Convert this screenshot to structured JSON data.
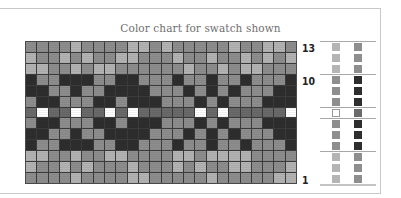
{
  "title": "Color chart for swatch shown",
  "colors": {
    "D": "#2e2e2e",
    "G": "#6a6a6a",
    "M": "#8e8e8e",
    "L": "#b4b4b4",
    "W": "#ffffff"
  },
  "row_labels": [
    {
      "text": "13",
      "row": 13
    },
    {
      "text": "10",
      "row": 10
    },
    {
      "text": "1",
      "row": 1
    }
  ],
  "chart_data": {
    "type": "heatmap",
    "title": "Color chart for swatch shown",
    "columns": 24,
    "rows": 13,
    "legend_key": {
      "D": "dark",
      "G": "dark gray",
      "M": "medium gray",
      "L": "light gray",
      "W": "white"
    },
    "grid_top_to_bottom": [
      [
        "M",
        "M",
        "M",
        "M",
        "L",
        "M",
        "M",
        "M",
        "M",
        "L",
        "L",
        "M",
        "L",
        "M",
        "M",
        "M",
        "M",
        "M",
        "L",
        "M",
        "M",
        "L",
        "L",
        "M"
      ],
      [
        "L",
        "M",
        "M",
        "L",
        "M",
        "L",
        "M",
        "M",
        "L",
        "L",
        "M",
        "M",
        "M",
        "L",
        "M",
        "M",
        "L",
        "M",
        "M",
        "L",
        "M",
        "L",
        "M",
        "L"
      ],
      [
        "L",
        "L",
        "M",
        "M",
        "L",
        "M",
        "L",
        "L",
        "M",
        "M",
        "M",
        "M",
        "M",
        "M",
        "L",
        "M",
        "M",
        "L",
        "M",
        "L",
        "L",
        "M",
        "M",
        "M"
      ],
      [
        "D",
        "M",
        "M",
        "D",
        "D",
        "D",
        "M",
        "M",
        "D",
        "D",
        "M",
        "M",
        "M",
        "D",
        "M",
        "M",
        "D",
        "M",
        "M",
        "D",
        "M",
        "M",
        "M",
        "D"
      ],
      [
        "D",
        "D",
        "M",
        "M",
        "D",
        "M",
        "M",
        "D",
        "D",
        "D",
        "D",
        "M",
        "M",
        "M",
        "D",
        "M",
        "D",
        "M",
        "D",
        "M",
        "M",
        "M",
        "D",
        "D"
      ],
      [
        "M",
        "D",
        "D",
        "M",
        "M",
        "M",
        "D",
        "D",
        "M",
        "D",
        "D",
        "D",
        "M",
        "M",
        "M",
        "D",
        "M",
        "D",
        "M",
        "M",
        "M",
        "D",
        "D",
        "D"
      ],
      [
        "G",
        "W",
        "G",
        "G",
        "W",
        "G",
        "G",
        "W",
        "G",
        "W",
        "G",
        "G",
        "G",
        "G",
        "G",
        "W",
        "G",
        "W",
        "G",
        "G",
        "G",
        "G",
        "G",
        "W"
      ],
      [
        "M",
        "D",
        "D",
        "M",
        "M",
        "M",
        "D",
        "D",
        "M",
        "D",
        "D",
        "D",
        "M",
        "M",
        "M",
        "D",
        "M",
        "D",
        "M",
        "M",
        "M",
        "D",
        "D",
        "D"
      ],
      [
        "D",
        "D",
        "M",
        "M",
        "D",
        "M",
        "M",
        "D",
        "D",
        "D",
        "D",
        "M",
        "M",
        "M",
        "D",
        "M",
        "D",
        "M",
        "D",
        "M",
        "M",
        "M",
        "D",
        "D"
      ],
      [
        "D",
        "M",
        "M",
        "D",
        "D",
        "D",
        "M",
        "M",
        "D",
        "D",
        "M",
        "M",
        "M",
        "D",
        "M",
        "M",
        "D",
        "M",
        "M",
        "D",
        "M",
        "M",
        "M",
        "D"
      ],
      [
        "L",
        "L",
        "M",
        "M",
        "L",
        "M",
        "M",
        "L",
        "L",
        "M",
        "M",
        "M",
        "M",
        "L",
        "L",
        "M",
        "L",
        "L",
        "L",
        "L",
        "M",
        "M",
        "M",
        "M"
      ],
      [
        "L",
        "M",
        "M",
        "L",
        "M",
        "L",
        "M",
        "M",
        "M",
        "L",
        "M",
        "M",
        "M",
        "L",
        "M",
        "L",
        "M",
        "M",
        "L",
        "L",
        "M",
        "M",
        "M",
        "L"
      ],
      [
        "M",
        "M",
        "M",
        "M",
        "L",
        "M",
        "M",
        "M",
        "M",
        "L",
        "L",
        "M",
        "M",
        "M",
        "M",
        "M",
        "L",
        "M",
        "M",
        "M",
        "M",
        "M",
        "L",
        "L"
      ]
    ],
    "legend_columns_top_to_bottom": {
      "left": [
        "L",
        "L",
        "L",
        "M",
        "M",
        "M",
        "W",
        "M",
        "M",
        "M",
        "L",
        "L",
        "L"
      ],
      "right": [
        "M",
        "M",
        "M",
        "D",
        "D",
        "D",
        "G",
        "D",
        "D",
        "D",
        "M",
        "M",
        "M"
      ]
    },
    "row_numbers_shown": [
      13,
      10,
      1
    ]
  }
}
